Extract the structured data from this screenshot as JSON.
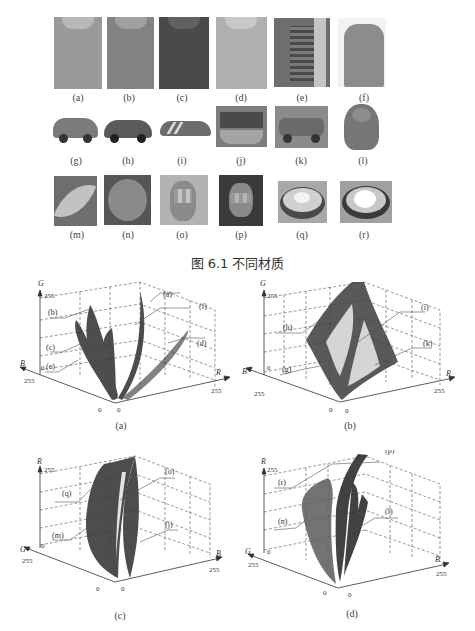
{
  "figure_6_1": {
    "caption": "图 6.1   不同材质",
    "thumbnails": [
      {
        "label": "(a)",
        "subject": "polo shirt light gray",
        "tone": "#9a9a9a"
      },
      {
        "label": "(b)",
        "subject": "polo shirt mid gray",
        "tone": "#838383"
      },
      {
        "label": "(c)",
        "subject": "polo shirt dark",
        "tone": "#4a4a4a"
      },
      {
        "label": "(d)",
        "subject": "polo shirt light",
        "tone": "#b0b0b0"
      },
      {
        "label": "(e)",
        "subject": "striped top with cardigan",
        "tone": "#6e6e6e"
      },
      {
        "label": "(f)",
        "subject": "coat on person",
        "tone": "#8c8c8c"
      },
      {
        "label": "(g)",
        "subject": "hatchback car",
        "tone": "#7b7b7b"
      },
      {
        "label": "(h)",
        "subject": "dark hatchback car",
        "tone": "#5a5a5a"
      },
      {
        "label": "(i)",
        "subject": "sports car",
        "tone": "#6c6c6c"
      },
      {
        "label": "(j)",
        "subject": "tram",
        "tone": "#7d7d7d"
      },
      {
        "label": "(k)",
        "subject": "SUV car",
        "tone": "#888888"
      },
      {
        "label": "(l)",
        "subject": "buddha statue",
        "tone": "#777777"
      },
      {
        "label": "(m)",
        "subject": "leaf",
        "tone": "#8e8e8e"
      },
      {
        "label": "(n)",
        "subject": "round leaf",
        "tone": "#7a7a7a"
      },
      {
        "label": "(o)",
        "subject": "face blurred",
        "tone": "#9a9a9a"
      },
      {
        "label": "(p)",
        "subject": "face blurred dark",
        "tone": "#5c5c5c"
      },
      {
        "label": "(q)",
        "subject": "glossy dish",
        "tone": "#a8a8a8"
      },
      {
        "label": "(r)",
        "subject": "glossy dish bright",
        "tone": "#a0a0a0"
      }
    ]
  },
  "plots": [
    {
      "caption": "(a)",
      "vertical_axis": "G",
      "left_axis": "B",
      "right_axis": "R",
      "tick_max": "255",
      "tick_zero": "0",
      "labels": [
        "(a)",
        "(b)",
        "(c)",
        "(d)",
        "(e)",
        "(f)"
      ]
    },
    {
      "caption": "(b)",
      "vertical_axis": "G",
      "left_axis": "B",
      "right_axis": "R",
      "tick_max": "255",
      "tick_zero": "0",
      "labels": [
        "(g)",
        "(h)",
        "(i)",
        "(k)"
      ]
    },
    {
      "caption": "(c)",
      "vertical_axis": "R",
      "left_axis": "G",
      "right_axis": "B",
      "tick_max": "255",
      "tick_zero": "0",
      "labels": [
        "(j)",
        "(m)",
        "(o)",
        "(q)"
      ]
    },
    {
      "caption": "(d)",
      "vertical_axis": "R",
      "left_axis": "G",
      "right_axis": "B",
      "tick_max": "255",
      "tick_zero": "0",
      "labels": [
        "(l)",
        "(n)",
        "(p)",
        "(r)"
      ]
    }
  ]
}
